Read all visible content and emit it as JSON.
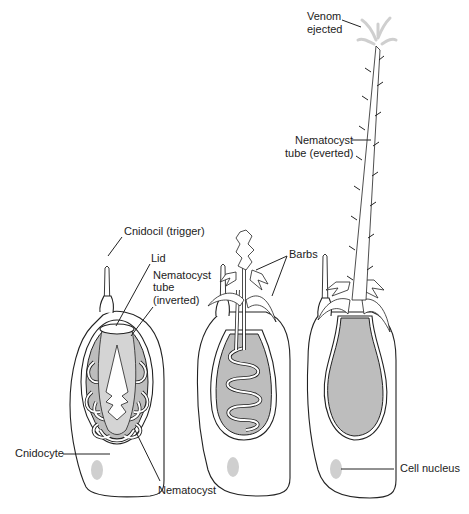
{
  "figure": {
    "type": "biological-diagram",
    "stages": [
      "undischarged",
      "discharging",
      "discharged"
    ],
    "colors": {
      "outline": "#222222",
      "capsule_fill": "#bdbdbd",
      "nucleus_fill": "#cfcfcf",
      "venom_spray": "#cfcfcf",
      "background": "#ffffff"
    }
  },
  "labels": {
    "venom": "Venom",
    "venom2": "ejected",
    "tube_everted_1": "Nematocyst",
    "tube_everted_2": "tube (everted)",
    "cnidocil": "Cnidocil (trigger)",
    "lid": "Lid",
    "tube_inverted_1": "Nematocyst",
    "tube_inverted_2": "tube",
    "tube_inverted_3": "(inverted)",
    "barbs": "Barbs",
    "cnidocyte": "Cnidocyte",
    "nematocyst": "Nematocyst",
    "nucleus": "Cell nucleus"
  }
}
